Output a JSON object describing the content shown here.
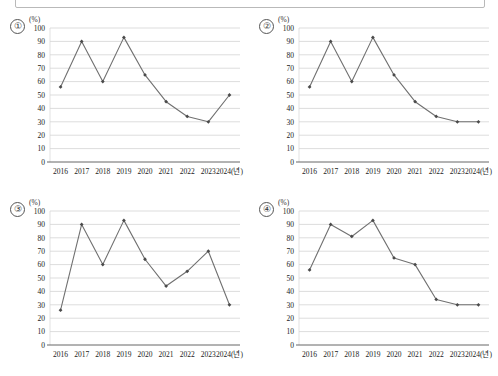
{
  "page": {
    "background_color": "#ffffff",
    "top_box": {
      "name": "answer-box",
      "border_color": "#b9b9b9"
    }
  },
  "axis": {
    "unit_label": "(%)",
    "x_axis_suffix_label": "2024(년)",
    "y_ticks": [
      "0",
      "10",
      "20",
      "30",
      "40",
      "50",
      "60",
      "70",
      "80",
      "90",
      "100"
    ],
    "x_ticks": [
      "2016",
      "2017",
      "2018",
      "2019",
      "2020",
      "2021",
      "2022",
      "2023",
      "2024(년)"
    ],
    "ymin": 0,
    "ymax": 100,
    "ystep": 10
  },
  "style_colors": {
    "line": "#707070",
    "marker": "#4a4a4a",
    "grid": "#cfcfcf",
    "axis": "#555555"
  },
  "chart_data": [
    {
      "type": "line",
      "option_label": "①",
      "title": "",
      "xlabel": "2024(년)",
      "ylabel": "(%)",
      "categories": [
        "2016",
        "2017",
        "2018",
        "2019",
        "2020",
        "2021",
        "2022",
        "2023",
        "2024"
      ],
      "values": [
        56,
        90,
        60,
        93,
        65,
        45,
        34,
        30,
        50
      ],
      "ylim": [
        0,
        100
      ],
      "grid": true,
      "legend": "none"
    },
    {
      "type": "line",
      "option_label": "②",
      "title": "",
      "xlabel": "2024(년)",
      "ylabel": "(%)",
      "categories": [
        "2016",
        "2017",
        "2018",
        "2019",
        "2020",
        "2021",
        "2022",
        "2023",
        "2024"
      ],
      "values": [
        56,
        90,
        60,
        93,
        65,
        45,
        34,
        30,
        30
      ],
      "ylim": [
        0,
        100
      ],
      "grid": true,
      "legend": "none"
    },
    {
      "type": "line",
      "option_label": "③",
      "title": "",
      "xlabel": "2024(년)",
      "ylabel": "(%)",
      "categories": [
        "2016",
        "2017",
        "2018",
        "2019",
        "2020",
        "2021",
        "2022",
        "2023",
        "2024"
      ],
      "values": [
        26,
        90,
        60,
        93,
        64,
        44,
        55,
        70,
        30
      ],
      "ylim": [
        0,
        100
      ],
      "grid": true,
      "legend": "none"
    },
    {
      "type": "line",
      "option_label": "④",
      "title": "",
      "xlabel": "2024(년)",
      "ylabel": "(%)",
      "categories": [
        "2016",
        "2017",
        "2018",
        "2019",
        "2020",
        "2021",
        "2022",
        "2023",
        "2024"
      ],
      "values": [
        56,
        90,
        81,
        93,
        65,
        60,
        34,
        30,
        30
      ],
      "ylim": [
        0,
        100
      ],
      "grid": true,
      "legend": "none"
    }
  ]
}
